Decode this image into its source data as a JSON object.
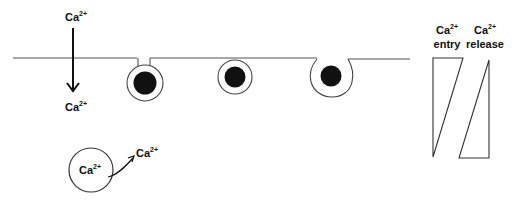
{
  "diagram": {
    "colors": {
      "line": "#555555",
      "ink": "#111111",
      "background": "#ffffff"
    },
    "membrane": {
      "x1": 13,
      "x2": 410,
      "y": 58
    },
    "influx": {
      "top_label": {
        "base": "Ca",
        "sup": "2+"
      },
      "bottom_label": {
        "base": "Ca",
        "sup": "2+"
      },
      "arrow_direction": "down"
    },
    "vesicles": [
      {
        "id": "docked-with-neck",
        "stage": "docked (fusion pore neck)"
      },
      {
        "id": "docked",
        "stage": "docked"
      },
      {
        "id": "fused",
        "stage": "fused / omega"
      }
    ],
    "store": {
      "inner_label": {
        "base": "Ca",
        "sup": "2+"
      },
      "released_label": {
        "base": "Ca",
        "sup": "2+"
      }
    },
    "gradients": {
      "entry": {
        "line1": {
          "base": "Ca",
          "sup": "2+"
        },
        "line2": "entry"
      },
      "release": {
        "line1": {
          "base": "Ca",
          "sup": "2+"
        },
        "line2": "release"
      }
    }
  }
}
